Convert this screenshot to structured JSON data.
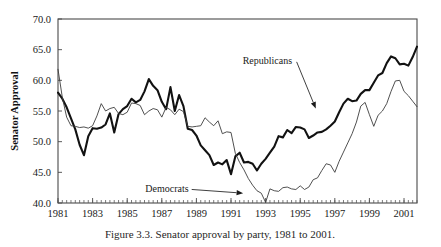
{
  "figure": {
    "caption": "Figure 3.3. Senator approval by party, 1981 to 2001."
  },
  "chart_data": {
    "type": "line",
    "title": "",
    "xlabel": "",
    "ylabel": "Senator Approval",
    "xlim": [
      1981,
      2001.75
    ],
    "ylim": [
      40.0,
      70.0
    ],
    "grid": false,
    "legend_position": "inline-annotations",
    "x_tick_labels": [
      "1981",
      "1983",
      "1985",
      "1987",
      "1989",
      "1991",
      "1993",
      "1995",
      "1997",
      "1999",
      "2001"
    ],
    "x_tick_values": [
      1981,
      1983,
      1985,
      1987,
      1989,
      1991,
      1993,
      1995,
      1997,
      1999,
      2001
    ],
    "x_minor_tick_interval": 0.25,
    "y_tick_labels": [
      "40.0",
      "45.0",
      "50.0",
      "55.0",
      "60.0",
      "65.0",
      "70.0"
    ],
    "y_tick_values": [
      40.0,
      45.0,
      50.0,
      55.0,
      60.0,
      65.0,
      70.0
    ],
    "annotations": [
      {
        "text": "Republicans",
        "label_x": 1993.1,
        "label_y": 62.6,
        "target_x": 1995.9,
        "target_y": 55.4
      },
      {
        "text": "Democrats",
        "label_x": 1987.3,
        "label_y": 41.8,
        "target_x": 1991.7,
        "target_y": 41.6
      }
    ],
    "series": [
      {
        "name": "Republicans",
        "style": "thick",
        "color": "#121212",
        "x": [
          1981.0,
          1981.25,
          1981.5,
          1981.75,
          1982.0,
          1982.25,
          1982.5,
          1982.75,
          1983.0,
          1983.25,
          1983.5,
          1983.75,
          1984.0,
          1984.25,
          1984.5,
          1984.75,
          1985.0,
          1985.25,
          1985.5,
          1985.75,
          1986.0,
          1986.25,
          1986.5,
          1986.75,
          1987.0,
          1987.25,
          1987.5,
          1987.75,
          1988.0,
          1988.25,
          1988.5,
          1988.75,
          1989.0,
          1989.25,
          1989.5,
          1989.75,
          1990.0,
          1990.25,
          1990.5,
          1990.75,
          1991.0,
          1991.25,
          1991.5,
          1991.75,
          1992.0,
          1992.25,
          1992.5,
          1992.75,
          1993.0,
          1993.25,
          1993.5,
          1993.75,
          1994.0,
          1994.25,
          1994.5,
          1994.75,
          1995.0,
          1995.25,
          1995.5,
          1995.75,
          1996.0,
          1996.25,
          1996.5,
          1996.75,
          1997.0,
          1997.25,
          1997.5,
          1997.75,
          1998.0,
          1998.25,
          1998.5,
          1998.75,
          1999.0,
          1999.25,
          1999.5,
          1999.75,
          2000.0,
          2000.25,
          2000.5,
          2000.75,
          2001.0,
          2001.25,
          2001.5,
          2001.75
        ],
        "y": [
          58.0,
          57.0,
          55.6,
          53.8,
          52.0,
          49.5,
          47.8,
          50.9,
          52.2,
          52.1,
          52.3,
          52.8,
          54.6,
          51.5,
          54.5,
          55.3,
          55.8,
          57.0,
          56.4,
          56.8,
          58.2,
          60.2,
          59.1,
          58.4,
          56.5,
          55.3,
          58.9,
          55.0,
          57.6,
          55.8,
          52.1,
          51.9,
          51.0,
          49.4,
          48.6,
          47.8,
          46.2,
          46.6,
          46.3,
          47.0,
          44.7,
          47.6,
          48.2,
          46.6,
          46.7,
          46.4,
          45.3,
          46.4,
          47.2,
          48.2,
          49.2,
          50.9,
          50.7,
          51.9,
          51.4,
          52.4,
          52.3,
          52.0,
          50.6,
          51.0,
          51.5,
          51.6,
          52.0,
          52.6,
          53.3,
          54.8,
          56.2,
          57.0,
          56.6,
          56.7,
          57.8,
          58.4,
          58.4,
          59.6,
          60.8,
          61.2,
          62.8,
          63.9,
          63.6,
          62.6,
          62.7,
          62.4,
          63.8,
          65.5
        ]
      },
      {
        "name": "Democrats",
        "style": "thin",
        "color": "#3c3c3c",
        "x": [
          1981.0,
          1981.25,
          1981.5,
          1981.75,
          1982.0,
          1982.25,
          1982.5,
          1982.75,
          1983.0,
          1983.25,
          1983.5,
          1983.75,
          1984.0,
          1984.25,
          1984.5,
          1984.75,
          1985.0,
          1985.25,
          1985.5,
          1985.75,
          1986.0,
          1986.25,
          1986.5,
          1986.75,
          1987.0,
          1987.25,
          1987.5,
          1987.75,
          1988.0,
          1988.25,
          1988.5,
          1988.75,
          1989.0,
          1989.25,
          1989.5,
          1989.75,
          1990.0,
          1990.25,
          1990.5,
          1990.75,
          1991.0,
          1991.25,
          1991.5,
          1991.75,
          1992.0,
          1992.25,
          1992.5,
          1992.75,
          1993.0,
          1993.25,
          1993.5,
          1993.75,
          1994.0,
          1994.25,
          1994.5,
          1994.75,
          1995.0,
          1995.25,
          1995.5,
          1995.75,
          1996.0,
          1996.25,
          1996.5,
          1996.75,
          1997.0,
          1997.25,
          1997.5,
          1997.75,
          1998.0,
          1998.25,
          1998.5,
          1998.75,
          1999.0,
          1999.25,
          1999.5,
          1999.75,
          2000.0,
          2000.25,
          2000.5,
          2000.75,
          2001.0,
          2001.25,
          2001.5,
          2001.75
        ],
        "y": [
          61.8,
          57.2,
          54.0,
          52.6,
          52.5,
          52.3,
          52.4,
          52.2,
          52.6,
          54.2,
          56.2,
          55.0,
          55.4,
          55.6,
          54.6,
          54.4,
          54.8,
          56.3,
          56.2,
          55.9,
          54.4,
          55.0,
          55.4,
          55.2,
          54.0,
          55.6,
          55.2,
          54.4,
          55.3,
          54.9,
          52.5,
          52.4,
          52.5,
          52.6,
          53.9,
          53.2,
          52.6,
          53.4,
          51.3,
          51.6,
          51.5,
          48.1,
          46.6,
          45.4,
          44.0,
          42.9,
          42.0,
          41.6,
          40.1,
          42.3,
          42.0,
          41.9,
          42.5,
          42.6,
          42.3,
          42.2,
          42.8,
          42.2,
          42.6,
          43.8,
          44.1,
          45.3,
          46.4,
          46.2,
          45.0,
          46.8,
          48.3,
          49.8,
          51.3,
          53.2,
          55.8,
          56.4,
          54.4,
          52.5,
          54.3,
          55.0,
          56.2,
          58.2,
          59.9,
          60.0,
          58.2,
          57.5,
          56.6,
          55.7
        ]
      }
    ]
  }
}
